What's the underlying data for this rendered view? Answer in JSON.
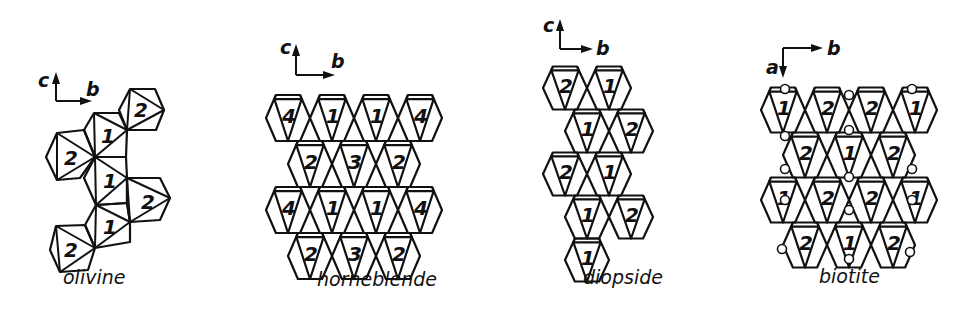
{
  "figure": {
    "panels": [
      {
        "name": "olivine",
        "caption": "olivine",
        "axes": {
          "vertical": "c",
          "vertical_dir": "up",
          "horizontal": "b",
          "horizontal_dir": "right"
        },
        "labels": [
          "2",
          "1",
          "2",
          "1",
          "2",
          "1",
          "2"
        ]
      },
      {
        "name": "horneblende",
        "caption": "horneblende",
        "axes": {
          "vertical": "c",
          "vertical_dir": "up",
          "horizontal": "b",
          "horizontal_dir": "right"
        },
        "rows": [
          [
            "4",
            "1",
            "1",
            "4"
          ],
          [
            "2",
            "3",
            "2"
          ],
          [
            "4",
            "1",
            "1",
            "4"
          ],
          [
            "2",
            "3",
            "2"
          ]
        ]
      },
      {
        "name": "diopside",
        "caption": "diopside",
        "axes": {
          "vertical": "c",
          "vertical_dir": "up",
          "horizontal": "b",
          "horizontal_dir": "right"
        },
        "rows": [
          [
            "2",
            "1"
          ],
          [
            "1",
            "2"
          ],
          [
            "2",
            "1"
          ],
          [
            "1",
            "2"
          ],
          [
            "1"
          ]
        ]
      },
      {
        "name": "biotite",
        "caption": "biotite",
        "axes": {
          "vertical": "a",
          "vertical_dir": "down",
          "horizontal": "b",
          "horizontal_dir": "right"
        },
        "rows": [
          [
            "1",
            "2",
            "2",
            "1"
          ],
          [
            "2",
            "1",
            "2"
          ],
          [
            "1",
            "2",
            "2",
            "1"
          ],
          [
            "2",
            "1",
            "2"
          ]
        ]
      }
    ]
  }
}
